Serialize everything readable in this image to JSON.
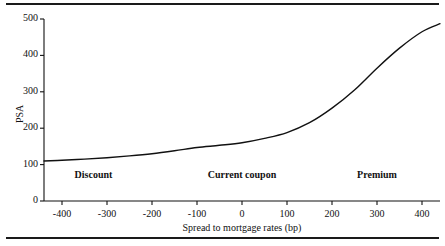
{
  "chart_data": {
    "type": "line",
    "title": "",
    "xlabel": "Spread to mortgage rates (bp)",
    "ylabel": "PSA",
    "xlim": [
      -440,
      440
    ],
    "ylim": [
      0,
      500
    ],
    "grid": false,
    "legend": "none",
    "xticks": [
      -400,
      -300,
      -200,
      -100,
      0,
      100,
      200,
      300,
      400
    ],
    "xticklabels": [
      "-400",
      "-300",
      "-200",
      "-100",
      "0",
      "100",
      "200",
      "300",
      "400"
    ],
    "yticks": [
      0,
      100,
      200,
      300,
      400,
      500
    ],
    "yticklabels": [
      "0",
      "100",
      "200",
      "300",
      "400",
      "500"
    ],
    "series": [
      {
        "name": "PSA prepayment S-curve",
        "x": [
          -440,
          -400,
          -350,
          -300,
          -250,
          -200,
          -150,
          -100,
          -50,
          0,
          50,
          100,
          150,
          200,
          250,
          300,
          350,
          400,
          440
        ],
        "values": [
          110,
          112,
          115,
          119,
          124,
          130,
          138,
          147,
          153,
          160,
          172,
          188,
          215,
          255,
          305,
          365,
          420,
          465,
          487
        ]
      }
    ],
    "annotations": [
      {
        "text": "Discount",
        "x": -330,
        "y": 68
      },
      {
        "text": "Current coupon",
        "x": 0,
        "y": 68
      },
      {
        "text": "Premium",
        "x": 300,
        "y": 68
      }
    ]
  },
  "axis": {
    "y_title": "PSA",
    "x_title": "Spread to mortgage rates (bp)"
  }
}
